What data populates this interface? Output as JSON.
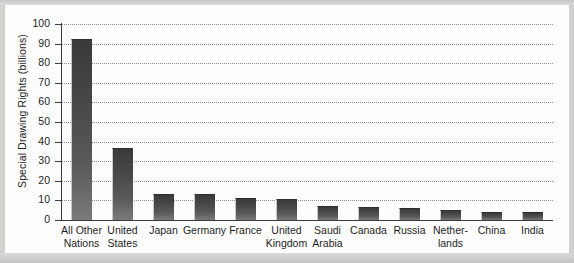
{
  "chart_data": {
    "type": "bar",
    "title": "",
    "subtitle": "",
    "xlabel": "",
    "ylabel": "Special Drawing Rights (billions)",
    "ylim": [
      0,
      100
    ],
    "yticks": [
      "0",
      "10",
      "20",
      "30",
      "40",
      "50",
      "60",
      "70",
      "80",
      "90",
      "100"
    ],
    "grid": true,
    "legend": "none",
    "categories": [
      "All Other Nations",
      "United States",
      "Japan",
      "Germany",
      "France",
      "United Kingdom",
      "Saudi Arabia",
      "Canada",
      "Russia",
      "Netherlands",
      "China",
      "India"
    ],
    "category_lines": [
      [
        "All Other",
        "Nations"
      ],
      [
        "United",
        "States"
      ],
      [
        "Japan",
        ""
      ],
      [
        "Germany",
        ""
      ],
      [
        "France",
        ""
      ],
      [
        "United",
        "Kingdom"
      ],
      [
        "Saudi",
        "Arabia"
      ],
      [
        "Canada",
        ""
      ],
      [
        "Russia",
        ""
      ],
      [
        "Nether-",
        "lands"
      ],
      [
        "China",
        ""
      ],
      [
        "India",
        ""
      ]
    ],
    "values": [
      92.5,
      36.5,
      13.4,
      13.4,
      11.0,
      10.6,
      7.0,
      6.4,
      5.9,
      5.2,
      4.1,
      4.0
    ],
    "bar_color": "#4a4a4a",
    "grid_color": "#8e8e8e",
    "axis_color": "#3b3b3b",
    "background": "#fdfdfd"
  }
}
